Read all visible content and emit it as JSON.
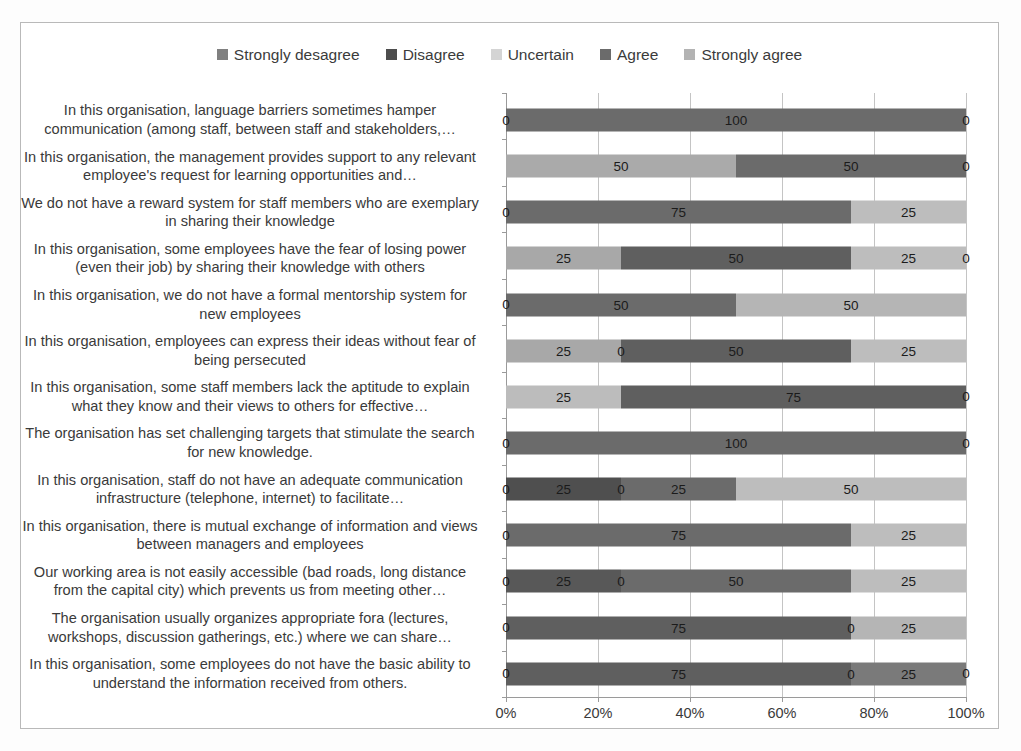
{
  "chart_data": {
    "type": "bar",
    "subtype": "stacked-bar-100-percent-horizontal",
    "title": "",
    "xlabel": "",
    "ylabel": "",
    "xlim": [
      0,
      100
    ],
    "xticks": [
      0,
      20,
      40,
      60,
      80,
      100
    ],
    "xtick_labels": [
      "0%",
      "20%",
      "40%",
      "60%",
      "80%",
      "100%"
    ],
    "grid": true,
    "legend_position": "top-center",
    "legend": [
      {
        "name": "Strongly desagree",
        "color": "#808080"
      },
      {
        "name": "Disagree",
        "color": "#4d4d4d"
      },
      {
        "name": "Uncertain",
        "color": "#d4d4d4"
      },
      {
        "name": "Agree",
        "color": "#6b6b6b"
      },
      {
        "name": "Strongly agree",
        "color": "#b3b3b3"
      }
    ],
    "categories": [
      "In this organisation, language barriers sometimes hamper communication (among staff, between staff and stakeholders,…",
      "In this organisation, the management provides support to any relevant employee's request for learning opportunities and…",
      "We do not have a reward system for staff members who are exemplary in sharing their knowledge",
      "In this organisation, some employees have the fear of losing power (even their job) by sharing their knowledge with others",
      "In this organisation, we do not have a formal mentorship system for new employees",
      "In this organisation, employees can express their ideas without fear of being persecuted",
      "In this organisation, some staff members lack the aptitude to explain what they know and their views to others for effective…",
      "The organisation has set challenging targets that stimulate the search for new knowledge.",
      "In this organisation, staff do not have an adequate communication infrastructure (telephone, internet) to facilitate…",
      "In this organisation, there is mutual exchange of information and views between managers and employees",
      "Our working area is not easily accessible (bad roads, long distance from the capital city) which prevents us from meeting other…",
      "The organisation usually organizes appropriate fora (lectures, workshops, discussion gatherings, etc.) where we can share…",
      "In this organisation, some employees do not have the basic ability to understand the information received from others."
    ],
    "series": [
      {
        "name": "Strongly desagree",
        "values": [
          0,
          0,
          0,
          0,
          0,
          0,
          0,
          0,
          0,
          0,
          0,
          0,
          0
        ]
      },
      {
        "name": "Disagree",
        "values": [
          0,
          0,
          0,
          0,
          0,
          0,
          0,
          0,
          25,
          0,
          25,
          0,
          0
        ]
      },
      {
        "name": "Uncertain",
        "values": [
          0,
          50,
          0,
          25,
          0,
          25,
          25,
          0,
          0,
          0,
          0,
          0,
          0
        ]
      },
      {
        "name": "Agree",
        "values": [
          100,
          50,
          75,
          50,
          50,
          50,
          75,
          100,
          25,
          75,
          50,
          75,
          75
        ]
      },
      {
        "name": "Strongly agree",
        "values": [
          0,
          0,
          25,
          25,
          50,
          25,
          0,
          0,
          50,
          25,
          25,
          25,
          25
        ]
      }
    ],
    "rows": [
      {
        "segments": [
          {
            "series": "Agree",
            "value": 100,
            "label": "100",
            "color": "#6b6b6b"
          }
        ],
        "left_cap": "0",
        "right_cap": "0"
      },
      {
        "segments": [
          {
            "series": "Uncertain",
            "value": 50,
            "label": "50",
            "color": "#aaaaaa"
          },
          {
            "series": "Agree",
            "value": 50,
            "label": "50",
            "color": "#6b6b6b"
          }
        ],
        "left_cap": "",
        "right_cap": "0"
      },
      {
        "segments": [
          {
            "series": "Agree",
            "value": 75,
            "label": "75",
            "color": "#6b6b6b"
          },
          {
            "series": "Strongly agree",
            "value": 25,
            "label": "25",
            "color": "#bdbdbd"
          }
        ],
        "left_cap": "0",
        "right_cap": ""
      },
      {
        "segments": [
          {
            "series": "Uncertain",
            "value": 25,
            "label": "25",
            "color": "#a8a8a8"
          },
          {
            "series": "Agree",
            "value": 50,
            "label": "50",
            "color": "#5f5f5f"
          },
          {
            "series": "Strongly agree",
            "value": 25,
            "label": "25",
            "color": "#bdbdbd"
          }
        ],
        "left_cap": "",
        "right_cap": "0"
      },
      {
        "segments": [
          {
            "series": "Agree",
            "value": 50,
            "label": "50",
            "color": "#6b6b6b"
          },
          {
            "series": "Strongly agree",
            "value": 50,
            "label": "50",
            "color": "#b5b5b5"
          }
        ],
        "left_cap": "0",
        "right_cap": ""
      },
      {
        "segments": [
          {
            "series": "Uncertain",
            "value": 25,
            "label": "25",
            "color": "#a8a8a8"
          },
          {
            "series": "Zero",
            "value": 0,
            "label": "0",
            "color": "#6b6b6b"
          },
          {
            "series": "Agree",
            "value": 50,
            "label": "50",
            "color": "#5f5f5f"
          },
          {
            "series": "Strongly agree",
            "value": 25,
            "label": "25",
            "color": "#bdbdbd"
          }
        ],
        "left_cap": "",
        "right_cap": ""
      },
      {
        "segments": [
          {
            "series": "Uncertain",
            "value": 25,
            "label": "25",
            "color": "#bcbcbc"
          },
          {
            "series": "Agree",
            "value": 75,
            "label": "75",
            "color": "#5f5f5f"
          }
        ],
        "left_cap": "",
        "right_cap": "0"
      },
      {
        "segments": [
          {
            "series": "Agree",
            "value": 100,
            "label": "100",
            "color": "#6b6b6b"
          }
        ],
        "left_cap": "0",
        "right_cap": "0"
      },
      {
        "segments": [
          {
            "series": "Disagree",
            "value": 25,
            "label": "25",
            "color": "#4f4f4f"
          },
          {
            "series": "Zero",
            "value": 0,
            "label": "0",
            "color": "#4f4f4f"
          },
          {
            "series": "Agree",
            "value": 25,
            "label": "25",
            "color": "#6b6b6b"
          },
          {
            "series": "Strongly agree",
            "value": 50,
            "label": "50",
            "color": "#bdbdbd"
          }
        ],
        "left_cap": "0",
        "right_cap": ""
      },
      {
        "segments": [
          {
            "series": "Agree",
            "value": 75,
            "label": "75",
            "color": "#6b6b6b"
          },
          {
            "series": "Strongly agree",
            "value": 25,
            "label": "25",
            "color": "#bdbdbd"
          }
        ],
        "left_cap": "0",
        "right_cap": ""
      },
      {
        "segments": [
          {
            "series": "Disagree",
            "value": 25,
            "label": "25",
            "color": "#585858"
          },
          {
            "series": "Zero",
            "value": 0,
            "label": "0",
            "color": "#585858"
          },
          {
            "series": "Agree",
            "value": 50,
            "label": "50",
            "color": "#6b6b6b"
          },
          {
            "series": "Strongly agree",
            "value": 25,
            "label": "25",
            "color": "#bdbdbd"
          }
        ],
        "left_cap": "0",
        "right_cap": ""
      },
      {
        "segments": [
          {
            "series": "Agree",
            "value": 75,
            "label": "75",
            "color": "#5f5f5f"
          },
          {
            "series": "Zero",
            "value": 0,
            "label": "0",
            "color": "#5f5f5f"
          },
          {
            "series": "Strongly agree",
            "value": 25,
            "label": "25",
            "color": "#b5b5b5"
          }
        ],
        "left_cap": "0",
        "right_cap": ""
      },
      {
        "segments": [
          {
            "series": "Agree",
            "value": 75,
            "label": "75",
            "color": "#5f5f5f"
          },
          {
            "series": "Zero",
            "value": 0,
            "label": "0",
            "color": "#5f5f5f"
          },
          {
            "series": "Agree2",
            "value": 25,
            "label": "25",
            "color": "#7a7a7a"
          }
        ],
        "left_cap": "0",
        "right_cap": "0"
      }
    ]
  }
}
